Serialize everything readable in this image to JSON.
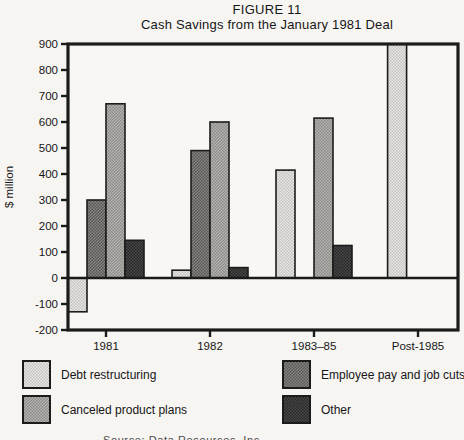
{
  "figure": {
    "label": "FIGURE 11",
    "title": "Cash Savings from the January 1981 Deal"
  },
  "chart_data": {
    "type": "bar",
    "title": "Cash Savings from the January 1981 Deal",
    "xlabel": "",
    "ylabel": "$ million",
    "ylim": [
      -200,
      900
    ],
    "yticks": [
      900,
      800,
      700,
      600,
      500,
      400,
      300,
      200,
      100,
      0,
      -100,
      -200
    ],
    "grid": false,
    "legend_position": "bottom",
    "categories": [
      "1981",
      "1982",
      "1983–85",
      "Post-1985"
    ],
    "series": [
      {
        "name": "Debt restructuring",
        "shade": "light",
        "values": [
          -130,
          30,
          415,
          900
        ]
      },
      {
        "name": "Employee pay and job cuts",
        "shade": "dark",
        "values": [
          300,
          490,
          null,
          null
        ]
      },
      {
        "name": "Canceled product plans",
        "shade": "medium",
        "values": [
          670,
          600,
          615,
          null
        ]
      },
      {
        "name": "Other",
        "shade": "darkest",
        "values": [
          145,
          40,
          125,
          null
        ]
      }
    ]
  },
  "palette": {
    "light": {
      "base": "#eae9e5",
      "dot": "#c2c1bd"
    },
    "medium": {
      "base": "#b7b6b3",
      "dot": "#8a8986"
    },
    "dark": {
      "base": "#868584",
      "dot": "#585756"
    },
    "darkest": {
      "base": "#4c4b4a",
      "dot": "#262525"
    },
    "frame": "#1b1b1b"
  },
  "legend": {
    "items": [
      {
        "name": "Debt restructuring",
        "shade": "light"
      },
      {
        "name": "Employee pay and job cuts",
        "shade": "dark"
      },
      {
        "name": "Canceled product plans",
        "shade": "medium"
      },
      {
        "name": "Other",
        "shade": "darkest"
      }
    ]
  },
  "source_line": "Source: Data Resources, Inc."
}
